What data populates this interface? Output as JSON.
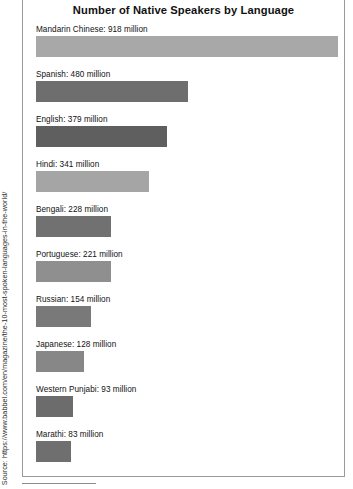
{
  "source": {
    "text": "Source: https://www.babbel.com/en/magazine/the-10-most-spoken-languages-in-the-world/"
  },
  "chart_data": {
    "type": "bar",
    "orientation": "horizontal",
    "title": "Number of Native Speakers by Language",
    "xlabel": "",
    "ylabel": "",
    "unit": "million",
    "grid": false,
    "legend": "none",
    "axis_visible": false,
    "xlim": [
      0,
      918
    ],
    "categories": [
      "Mandarin Chinese",
      "Spanish",
      "English",
      "Hindi",
      "Bengali",
      "Portuguese",
      "Russian",
      "Japanese",
      "Western Punjabi",
      "Marathi"
    ],
    "values": [
      918,
      480,
      379,
      341,
      228,
      221,
      154,
      128,
      93,
      83
    ],
    "value_labels": [
      "Mandarin Chinese: 918 million",
      "Spanish: 480 million",
      "English: 379 million",
      "Hindi: 341 million",
      "Bengali: 228 million",
      "Portuguese: 221 million",
      "Russian: 154 million",
      "Japanese: 128 million",
      "Western Punjabi: 93 million",
      "Marathi: 83 million"
    ],
    "bar_colors": [
      "#a8a8a8",
      "#6e6e6e",
      "#5f5f5f",
      "#a5a5a5",
      "#717171",
      "#8f8f8f",
      "#797979",
      "#878787",
      "#6c6c6c",
      "#6f6f6f"
    ],
    "bar_pixel_widths": [
      302,
      152,
      131,
      113,
      75,
      75,
      55,
      48,
      37,
      35
    ]
  }
}
